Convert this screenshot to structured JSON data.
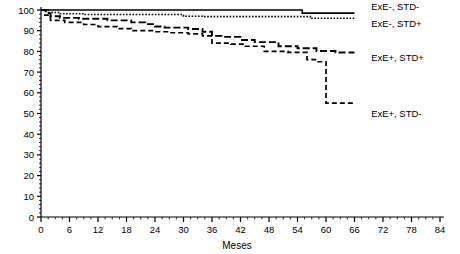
{
  "chart_data": {
    "type": "line",
    "subtype": "kaplan-meier-step",
    "title": "",
    "xlabel": "Meses",
    "ylabel": "",
    "xlim": [
      0,
      84
    ],
    "ylim": [
      0,
      100
    ],
    "xticks": [
      0,
      6,
      12,
      18,
      24,
      30,
      36,
      42,
      48,
      54,
      60,
      66,
      72,
      78,
      84
    ],
    "yticks": [
      0,
      10,
      20,
      30,
      40,
      50,
      60,
      70,
      80,
      90,
      100
    ],
    "xtick_labels": [
      "0",
      "6",
      "12",
      "18",
      "24",
      "30",
      "36",
      "42",
      "48",
      "54",
      "60",
      "66",
      "72",
      "78",
      "84"
    ],
    "ytick_labels": [
      "0",
      "10",
      "20",
      "30",
      "40",
      "50",
      "60",
      "70",
      "80",
      "90",
      "100"
    ],
    "minor_ticks": true,
    "grid": false,
    "legend_position": "inline-right-of-curve-ends",
    "series": [
      {
        "name": "ExE-, STD-",
        "style": "solid",
        "color": "#000000",
        "label_x": 69.5,
        "label_y": 101.5,
        "points": [
          [
            0,
            100
          ],
          [
            55,
            100
          ],
          [
            55,
            98.5
          ],
          [
            66,
            98.5
          ]
        ]
      },
      {
        "name": "ExE-, STD+",
        "style": "dotted",
        "color": "#000000",
        "label_x": 69.5,
        "label_y": 93.5,
        "points": [
          [
            0,
            100
          ],
          [
            1.5,
            100
          ],
          [
            1.5,
            98.8
          ],
          [
            4,
            98.8
          ],
          [
            4,
            98.2
          ],
          [
            9,
            98.2
          ],
          [
            9,
            97.8
          ],
          [
            30,
            97.8
          ],
          [
            30,
            97.0
          ],
          [
            34,
            97.0
          ],
          [
            34,
            96.8
          ],
          [
            57,
            96.8
          ],
          [
            57,
            96.0
          ],
          [
            66,
            96.0
          ]
        ]
      },
      {
        "name": "ExE+, STD+",
        "style": "longdash",
        "color": "#000000",
        "label_x": 69.5,
        "label_y": 77.0,
        "points": [
          [
            0,
            100
          ],
          [
            1,
            100
          ],
          [
            1,
            98.5
          ],
          [
            2,
            98.5
          ],
          [
            2,
            97.0
          ],
          [
            4,
            97.0
          ],
          [
            4,
            96.2
          ],
          [
            8,
            96.2
          ],
          [
            8,
            95.8
          ],
          [
            14,
            95.8
          ],
          [
            14,
            95.0
          ],
          [
            19,
            95.0
          ],
          [
            19,
            94.0
          ],
          [
            22,
            94.0
          ],
          [
            22,
            93.2
          ],
          [
            24,
            93.2
          ],
          [
            24,
            92.0
          ],
          [
            26,
            92.0
          ],
          [
            26,
            91.5
          ],
          [
            31,
            91.5
          ],
          [
            31,
            90.8
          ],
          [
            34,
            90.8
          ],
          [
            34,
            89.5
          ],
          [
            36,
            89.5
          ],
          [
            36,
            87.5
          ],
          [
            38,
            87.5
          ],
          [
            38,
            87.0
          ],
          [
            42,
            87.0
          ],
          [
            42,
            85.5
          ],
          [
            45,
            85.5
          ],
          [
            45,
            84.5
          ],
          [
            50,
            84.5
          ],
          [
            50,
            82.5
          ],
          [
            54,
            82.5
          ],
          [
            54,
            81.5
          ],
          [
            58,
            81.5
          ],
          [
            58,
            80.2
          ],
          [
            62,
            80.2
          ],
          [
            62,
            79.5
          ],
          [
            66,
            79.5
          ]
        ]
      },
      {
        "name": "ExE+, STD-",
        "style": "dash",
        "color": "#000000",
        "label_x": 69.5,
        "label_y": 50.0,
        "points": [
          [
            0,
            100
          ],
          [
            0.8,
            100
          ],
          [
            0.8,
            97.5
          ],
          [
            2,
            97.5
          ],
          [
            2,
            95.0
          ],
          [
            5,
            95.0
          ],
          [
            5,
            94.0
          ],
          [
            9,
            94.0
          ],
          [
            9,
            93.0
          ],
          [
            12,
            93.0
          ],
          [
            12,
            92.0
          ],
          [
            16,
            92.0
          ],
          [
            16,
            91.0
          ],
          [
            19,
            91.0
          ],
          [
            19,
            90.0
          ],
          [
            24,
            90.0
          ],
          [
            24,
            89.5
          ],
          [
            27,
            89.5
          ],
          [
            27,
            89.0
          ],
          [
            31,
            89.0
          ],
          [
            31,
            88.5
          ],
          [
            34,
            88.5
          ],
          [
            34,
            87.5
          ],
          [
            36,
            87.5
          ],
          [
            36,
            84.0
          ],
          [
            40,
            84.0
          ],
          [
            40,
            83.5
          ],
          [
            43,
            83.5
          ],
          [
            43,
            82.5
          ],
          [
            47,
            82.5
          ],
          [
            47,
            80.0
          ],
          [
            52,
            80.0
          ],
          [
            52,
            79.5
          ],
          [
            56,
            79.5
          ],
          [
            56,
            76.0
          ],
          [
            58,
            76.0
          ],
          [
            58,
            75.0
          ],
          [
            60,
            75.0
          ],
          [
            60,
            55.0
          ],
          [
            66,
            55.0
          ]
        ]
      }
    ]
  },
  "axes": {
    "x_axis_name": "Meses",
    "y_axis_name": ""
  }
}
